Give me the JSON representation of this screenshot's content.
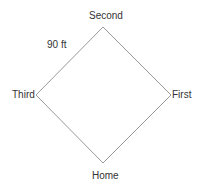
{
  "diagram": {
    "title": "",
    "shape": "baseball-diamond",
    "line_color": "#999999",
    "text_color": "#333333",
    "vertices": {
      "second": {
        "x": 103,
        "y": 27
      },
      "first": {
        "x": 171,
        "y": 95
      },
      "home": {
        "x": 103,
        "y": 163
      },
      "third": {
        "x": 36,
        "y": 95
      }
    },
    "labels": {
      "second": "Second",
      "first": "First",
      "home": "Home",
      "third": "Third",
      "side_length": "90 ft"
    }
  }
}
